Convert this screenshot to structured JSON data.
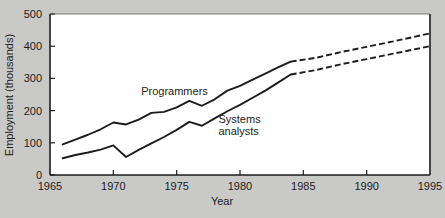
{
  "chart_data": {
    "type": "line",
    "title": "",
    "xlabel": "Year",
    "ylabel": "Employment (thousands)",
    "xlim": [
      1965,
      1995
    ],
    "ylim": [
      0,
      500
    ],
    "xticks": [
      1965,
      1970,
      1975,
      1980,
      1985,
      1990,
      1995
    ],
    "yticks": [
      0,
      100,
      200,
      300,
      400,
      500
    ],
    "grid": false,
    "legend_position": "inline-annotations",
    "projection_start_year": 1984,
    "series": [
      {
        "name": "Programmers",
        "label_x": 1972.2,
        "label_y": 250,
        "x": [
          1966,
          1967,
          1968,
          1969,
          1970,
          1971,
          1972,
          1973,
          1974,
          1975,
          1976,
          1977,
          1978,
          1979,
          1980,
          1981,
          1982,
          1983,
          1984,
          1986,
          1988,
          1990,
          1992,
          1995
        ],
        "values": [
          95,
          110,
          125,
          142,
          163,
          157,
          172,
          193,
          196,
          210,
          230,
          215,
          235,
          262,
          277,
          296,
          315,
          334,
          352,
          364,
          382,
          398,
          414,
          440
        ]
      },
      {
        "name": "Systems analysts",
        "label_x": 1978.3,
        "label_y": 160,
        "x": [
          1966,
          1967,
          1968,
          1969,
          1970,
          1971,
          1972,
          1973,
          1974,
          1975,
          1976,
          1977,
          1978,
          1979,
          1980,
          1981,
          1982,
          1983,
          1984,
          1986,
          1988,
          1990,
          1992,
          1995
        ],
        "values": [
          52,
          62,
          70,
          79,
          92,
          56,
          78,
          98,
          118,
          140,
          165,
          153,
          176,
          198,
          218,
          240,
          262,
          287,
          312,
          326,
          344,
          360,
          376,
          400
        ]
      }
    ]
  },
  "labels": {
    "y_axis_title": "Employment (thousands)",
    "x_axis_title": "Year",
    "series_programmers": "Programmers",
    "series_systems_line1": "Systems",
    "series_systems_line2": "analysts",
    "ytick_0": "0",
    "ytick_100": "100",
    "ytick_200": "200",
    "ytick_300": "300",
    "ytick_400": "400",
    "ytick_500": "500",
    "xtick_1965": "1965",
    "xtick_1970": "1970",
    "xtick_1975": "1975",
    "xtick_1980": "1980",
    "xtick_1985": "1985",
    "xtick_1990": "1990",
    "xtick_1995": "1995"
  },
  "colors": {
    "background": "#c9c9c7",
    "plot_area": "#ffffff",
    "line": "#1c1c1c",
    "axis": "#1c1c1c",
    "text": "#1c1c1c"
  }
}
